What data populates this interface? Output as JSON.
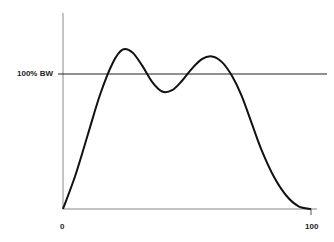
{
  "chart_data": {
    "type": "line",
    "title": "",
    "xlabel": "",
    "ylabel": "",
    "x_tick_labels": [
      "0",
      "100"
    ],
    "xlim": [
      0,
      100
    ],
    "reference_line": {
      "label": "100% BW",
      "y": 100
    },
    "ylim": [
      0,
      135
    ],
    "grid": false,
    "legend": null,
    "series": [
      {
        "name": "response",
        "x": [
          0,
          5,
          10,
          15,
          20,
          24,
          28,
          32,
          36,
          40,
          44,
          48,
          52,
          56,
          60,
          64,
          68,
          72,
          76,
          80,
          85,
          90,
          95,
          100
        ],
        "y": [
          0,
          25,
          55,
          85,
          108,
          118,
          116,
          106,
          94,
          87,
          88,
          95,
          104,
          111,
          113,
          109,
          99,
          84,
          64,
          44,
          24,
          10,
          2,
          0
        ]
      }
    ],
    "colors": {
      "curve": "#111111",
      "axes": "#888888",
      "reference_line": "#222222"
    }
  }
}
